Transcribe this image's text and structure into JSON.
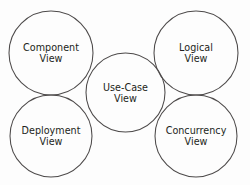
{
  "diagram": {
    "type": "venn-circles",
    "canvas": {
      "width": 250,
      "height": 185
    },
    "background_color": "#fdfdfd",
    "stroke_color": "#4d4a4a",
    "text_color": "#231f20",
    "nodes": [
      {
        "id": "component-view",
        "line1": "Component",
        "line2": "View",
        "cx": 51,
        "cy": 53,
        "r": 42,
        "label_x": 51,
        "label_y": 53
      },
      {
        "id": "logical-view",
        "line1": "Logical",
        "line2": "View",
        "cx": 196,
        "cy": 53,
        "r": 42,
        "label_x": 196,
        "label_y": 53
      },
      {
        "id": "use-case-view",
        "line1": "Use-Case",
        "line2": "View",
        "cx": 125.5,
        "cy": 92.5,
        "r": 39.5,
        "label_x": 125.5,
        "label_y": 93
      },
      {
        "id": "deployment-view",
        "line1": "Deployment",
        "line2": "View",
        "cx": 51,
        "cy": 136,
        "r": 41,
        "label_x": 51,
        "label_y": 136
      },
      {
        "id": "concurrency-view",
        "line1": "Concurrency",
        "line2": "View",
        "cx": 196,
        "cy": 136,
        "r": 41,
        "label_x": 196,
        "label_y": 136
      }
    ]
  }
}
